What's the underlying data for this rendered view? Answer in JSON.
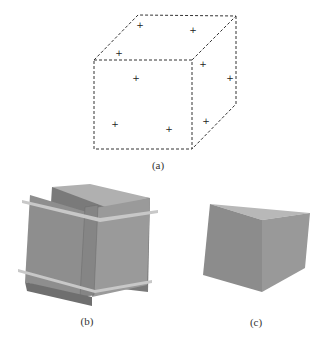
{
  "figure": {
    "panels": [
      {
        "id": "a",
        "label": "(a)",
        "description": "dashed wireframe cube with sample points"
      },
      {
        "id": "b",
        "label": "(b)",
        "description": "cube with intersecting slab planes"
      },
      {
        "id": "c",
        "label": "(c)",
        "description": "solid shaded cube"
      }
    ]
  },
  "colors": {
    "line": "#333333",
    "face_front": "#8a8a8a",
    "face_side": "#969696",
    "face_top": "#b4b4b4",
    "slab_light": "#c8c8c8",
    "slab_dark": "#7a7a7a"
  }
}
